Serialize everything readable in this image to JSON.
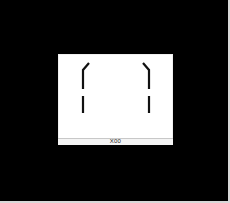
{
  "viewport": {
    "background_color": "#000000",
    "frame_color": "#d8d8d8"
  },
  "panel": {
    "background_color": "#ffffff",
    "stroke_color": "#111111",
    "status_label": "X00"
  },
  "brackets": {
    "left": {
      "icon": "left-bracket-mark"
    },
    "right": {
      "icon": "right-bracket-mark"
    }
  }
}
